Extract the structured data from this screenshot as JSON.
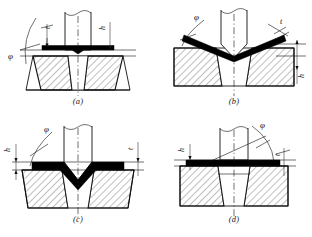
{
  "figure": {
    "background_color": "#ffffff",
    "line_color": "#111111",
    "sheet_color": "#000000"
  },
  "symbols": {
    "angle": "φ",
    "thickness": "t",
    "height": "h"
  },
  "panels": [
    {
      "id": "a",
      "caption": "(a)",
      "description": "Flat punch pressing flat sheet over a wide tapered die opening; sheet begins to bend downward at the edges",
      "labels": {
        "angle": "φ",
        "thickness": "t",
        "height": "h"
      },
      "label_positions": {
        "angle": "left",
        "thickness": "top-left",
        "height": "top-right"
      }
    },
    {
      "id": "b",
      "caption": "(b)",
      "description": "Sheet fully bent into a V against the die cavity; punch seated in the vee",
      "labels": {
        "angle": "φ",
        "thickness": "t",
        "height": "h"
      },
      "label_positions": {
        "angle": "top-left",
        "thickness": "top-right",
        "height": "right"
      }
    },
    {
      "id": "c",
      "caption": "(c)",
      "description": "V-shaped punch driving the sheet into a V-groove die; sheet bent at the centre",
      "labels": {
        "angle": "φ",
        "thickness": "t",
        "height": "h"
      },
      "label_positions": {
        "angle": "top-left",
        "thickness": "top-right",
        "height": "left"
      }
    },
    {
      "id": "d",
      "caption": "(d)",
      "description": "Flat sheet resting on the die face with inclined reference line indicating the bend angle",
      "labels": {
        "angle": "φ",
        "thickness": "t",
        "height": "h"
      },
      "label_positions": {
        "angle": "top-right",
        "thickness": "right",
        "height": "top-left"
      }
    }
  ]
}
